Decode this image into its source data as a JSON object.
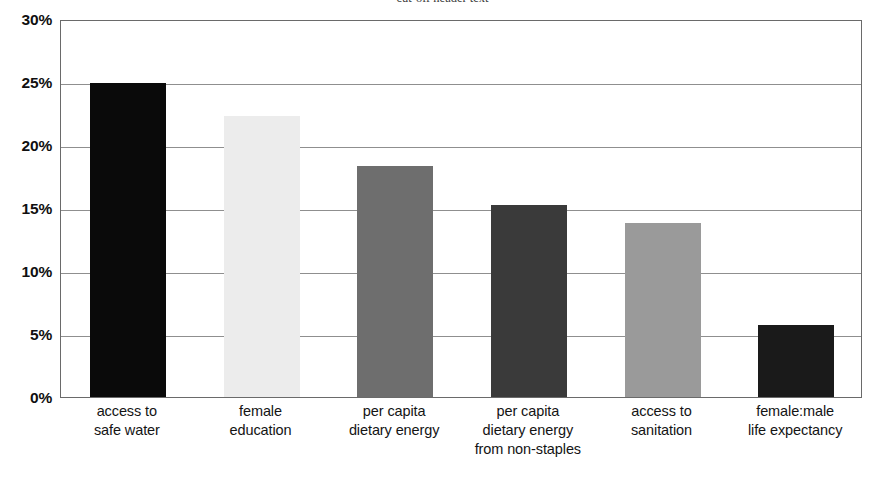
{
  "chart_data": {
    "type": "bar",
    "title": "cut-off header text",
    "xlabel": "",
    "ylabel": "",
    "ylim": [
      0,
      30
    ],
    "y_tick_labels": [
      "30%",
      "25%",
      "20%",
      "15%",
      "10%",
      "5%",
      "0%"
    ],
    "y_tick_values": [
      30,
      25,
      20,
      15,
      10,
      5,
      0
    ],
    "grid": true,
    "legend": "none",
    "categories": [
      "access to safe water",
      "female education",
      "per capita dietary energy",
      "per capita dietary energy from non-staples",
      "access to sanitation",
      "female:male life expectancy"
    ],
    "category_lines": [
      [
        "access to",
        "safe water"
      ],
      [
        "female",
        "education"
      ],
      [
        "per capita",
        "dietary energy"
      ],
      [
        "per capita",
        "dietary energy",
        "from non-staples"
      ],
      [
        "access to",
        "sanitation"
      ],
      [
        "female:male",
        "life expectancy"
      ]
    ],
    "values": [
      24.9,
      22.3,
      18.3,
      15.2,
      13.8,
      5.7
    ],
    "value_labels": [
      "24.9%",
      "22.3%",
      "18.3%",
      "15.2%",
      "13.8%",
      "5.7%"
    ],
    "bar_colors": [
      "#0a0a0a",
      "#ececec",
      "#6e6e6e",
      "#3a3a3a",
      "#9a9a9a",
      "#1a1a1a"
    ]
  },
  "axis": {
    "frame_color": "#6a6a6a",
    "gridline_color": "#8f8f8f"
  }
}
